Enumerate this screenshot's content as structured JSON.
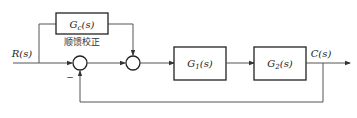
{
  "diagram": {
    "type": "control-block-diagram",
    "input_label": "R(s)",
    "output_label": "C(s)",
    "blocks": [
      {
        "id": "gc",
        "label": "G_c(s)",
        "main": "G",
        "sub": "c",
        "tail": "(s)"
      },
      {
        "id": "g1",
        "label": "G_1(s)",
        "main": "G",
        "sub": "1",
        "tail": "(s)"
      },
      {
        "id": "g2",
        "label": "G_2(s)",
        "main": "G",
        "sub": "2",
        "tail": "(s)"
      }
    ],
    "feedforward_caption": "顺馈校正",
    "summing_junctions": [
      {
        "id": "sum1",
        "feedback_sign": "−"
      },
      {
        "id": "sum2"
      }
    ],
    "colors": {
      "line": "#555555",
      "box": "#222222",
      "background": "#ffffff"
    }
  }
}
